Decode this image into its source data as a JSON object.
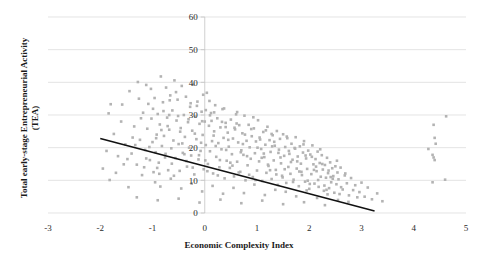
{
  "chart_data": {
    "type": "scatter",
    "title": "",
    "xlabel": "Economic Complexity Index",
    "ylabel": "Total early-stage Entrepreneurial Activity (TEA)",
    "xlim": [
      -3.4,
      5.3
    ],
    "ylim": [
      0,
      62
    ],
    "xticks": [
      -3,
      -2,
      -1,
      0,
      1,
      2,
      3,
      4,
      5
    ],
    "xtick_labels": [
      "-3",
      "-2",
      "-1",
      "0",
      "1",
      "2",
      "3",
      "4",
      "5"
    ],
    "yticks": [
      0,
      10,
      20,
      30,
      40,
      50,
      60
    ],
    "ytick_labels": [
      "0",
      "10",
      "20",
      "30",
      "40",
      "50",
      "60"
    ],
    "grid": "horizontal",
    "legend": "none",
    "marker": {
      "shape": "square",
      "color": "#b3b3b3",
      "size": 2.6
    },
    "trendline": {
      "type": "linear",
      "color": "#111111",
      "x_start": -2.0,
      "y_start": 22.8,
      "x_end": 3.25,
      "y_end": 0.6,
      "slope": -4.23,
      "intercept": 14.34
    },
    "points": [
      [
        -1.95,
        13.6
      ],
      [
        -1.82,
        10.1
      ],
      [
        -1.74,
        24.2
      ],
      [
        -1.66,
        17.4
      ],
      [
        -1.58,
        33.2
      ],
      [
        -1.52,
        21.0
      ],
      [
        -1.46,
        7.9
      ],
      [
        -1.4,
        18.2
      ],
      [
        -1.35,
        26.5
      ],
      [
        -1.3,
        14.8
      ],
      [
        -1.28,
        40.1
      ],
      [
        -1.24,
        22.4
      ],
      [
        -1.2,
        11.6
      ],
      [
        -1.18,
        30.7
      ],
      [
        -1.14,
        19.3
      ],
      [
        -1.1,
        25.8
      ],
      [
        -1.08,
        33.4
      ],
      [
        -1.05,
        16.2
      ],
      [
        -1.02,
        28.9
      ],
      [
        -1.0,
        21.7
      ],
      [
        -0.98,
        12.5
      ],
      [
        -0.96,
        35.2
      ],
      [
        -0.94,
        18.6
      ],
      [
        -0.92,
        24.0
      ],
      [
        -0.9,
        30.3
      ],
      [
        -0.88,
        15.4
      ],
      [
        -0.86,
        27.1
      ],
      [
        -0.84,
        41.8
      ],
      [
        -0.82,
        20.5
      ],
      [
        -0.8,
        33.9
      ],
      [
        -0.78,
        23.6
      ],
      [
        -0.76,
        17.0
      ],
      [
        -0.74,
        38.4
      ],
      [
        -0.72,
        29.2
      ],
      [
        -0.7,
        13.1
      ],
      [
        -0.68,
        25.5
      ],
      [
        -0.66,
        36.0
      ],
      [
        -0.64,
        19.8
      ],
      [
        -0.62,
        31.4
      ],
      [
        -0.6,
        22.2
      ],
      [
        -0.58,
        40.6
      ],
      [
        -0.56,
        16.8
      ],
      [
        -0.54,
        28.3
      ],
      [
        -0.52,
        34.7
      ],
      [
        -0.5,
        21.1
      ],
      [
        -0.48,
        12.9
      ],
      [
        -0.46,
        26.0
      ],
      [
        -0.44,
        38.9
      ],
      [
        -0.42,
        18.4
      ],
      [
        -0.4,
        30.0
      ],
      [
        -0.38,
        23.3
      ],
      [
        -0.36,
        35.6
      ],
      [
        -0.34,
        14.2
      ],
      [
        -0.32,
        27.8
      ],
      [
        -0.3,
        20.0
      ],
      [
        -0.28,
        32.5
      ],
      [
        -0.26,
        17.6
      ],
      [
        -0.24,
        25.2
      ],
      [
        -0.22,
        39.3
      ],
      [
        -0.2,
        11.8
      ],
      [
        -0.18,
        29.5
      ],
      [
        -0.16,
        22.6
      ],
      [
        -0.14,
        34.1
      ],
      [
        -0.12,
        16.4
      ],
      [
        -0.1,
        27.3
      ],
      [
        -0.08,
        19.0
      ],
      [
        -0.06,
        31.0
      ],
      [
        -0.04,
        23.9
      ],
      [
        -0.02,
        13.4
      ],
      [
        0.0,
        28.0
      ],
      [
        0.02,
        20.8
      ],
      [
        0.04,
        36.8
      ],
      [
        0.06,
        15.0
      ],
      [
        0.08,
        26.7
      ],
      [
        0.1,
        18.9
      ],
      [
        0.12,
        30.6
      ],
      [
        0.14,
        22.0
      ],
      [
        0.16,
        12.1
      ],
      [
        0.18,
        25.0
      ],
      [
        0.2,
        33.0
      ],
      [
        0.22,
        17.2
      ],
      [
        0.24,
        29.0
      ],
      [
        0.26,
        21.4
      ],
      [
        0.28,
        14.0
      ],
      [
        0.3,
        26.2
      ],
      [
        0.32,
        19.5
      ],
      [
        0.34,
        31.8
      ],
      [
        0.36,
        23.0
      ],
      [
        0.38,
        10.6
      ],
      [
        0.4,
        27.6
      ],
      [
        0.42,
        16.0
      ],
      [
        0.44,
        24.6
      ],
      [
        0.46,
        20.3
      ],
      [
        0.48,
        13.8
      ],
      [
        0.5,
        28.6
      ],
      [
        0.52,
        18.0
      ],
      [
        0.54,
        22.8
      ],
      [
        0.56,
        11.2
      ],
      [
        0.58,
        25.6
      ],
      [
        0.6,
        30.2
      ],
      [
        0.62,
        15.7
      ],
      [
        0.64,
        21.6
      ],
      [
        0.66,
        26.9
      ],
      [
        0.68,
        12.6
      ],
      [
        0.7,
        19.2
      ],
      [
        0.72,
        24.4
      ],
      [
        0.74,
        17.8
      ],
      [
        0.76,
        29.8
      ],
      [
        0.78,
        10.0
      ],
      [
        0.8,
        22.1
      ],
      [
        0.82,
        14.6
      ],
      [
        0.84,
        27.0
      ],
      [
        0.86,
        20.1
      ],
      [
        0.88,
        16.6
      ],
      [
        0.9,
        23.5
      ],
      [
        0.92,
        11.0
      ],
      [
        0.94,
        25.9
      ],
      [
        0.96,
        18.3
      ],
      [
        0.98,
        21.9
      ],
      [
        1.0,
        13.0
      ],
      [
        1.02,
        28.4
      ],
      [
        1.04,
        15.8
      ],
      [
        1.06,
        22.5
      ],
      [
        1.08,
        19.6
      ],
      [
        1.1,
        9.8
      ],
      [
        1.12,
        24.8
      ],
      [
        1.14,
        17.1
      ],
      [
        1.16,
        20.9
      ],
      [
        1.18,
        12.3
      ],
      [
        1.2,
        26.4
      ],
      [
        1.22,
        14.4
      ],
      [
        1.24,
        22.3
      ],
      [
        1.26,
        18.7
      ],
      [
        1.28,
        10.4
      ],
      [
        1.3,
        23.8
      ],
      [
        1.32,
        16.1
      ],
      [
        1.34,
        20.6
      ],
      [
        1.36,
        13.2
      ],
      [
        1.38,
        25.1
      ],
      [
        1.4,
        8.6
      ],
      [
        1.42,
        19.4
      ],
      [
        1.44,
        22.7
      ],
      [
        1.46,
        15.2
      ],
      [
        1.48,
        11.4
      ],
      [
        1.5,
        24.1
      ],
      [
        1.52,
        17.5
      ],
      [
        1.54,
        20.2
      ],
      [
        1.56,
        9.2
      ],
      [
        1.58,
        22.9
      ],
      [
        1.6,
        14.1
      ],
      [
        1.62,
        18.1
      ],
      [
        1.64,
        12.0
      ],
      [
        1.66,
        21.2
      ],
      [
        1.68,
        16.3
      ],
      [
        1.7,
        10.2
      ],
      [
        1.72,
        19.9
      ],
      [
        1.74,
        23.2
      ],
      [
        1.76,
        13.6
      ],
      [
        1.78,
        17.3
      ],
      [
        1.8,
        8.2
      ],
      [
        1.82,
        20.4
      ],
      [
        1.84,
        15.1
      ],
      [
        1.86,
        11.6
      ],
      [
        1.88,
        18.5
      ],
      [
        1.9,
        22.0
      ],
      [
        1.92,
        9.6
      ],
      [
        1.94,
        16.7
      ],
      [
        1.96,
        13.5
      ],
      [
        1.98,
        19.1
      ],
      [
        2.0,
        7.4
      ],
      [
        2.02,
        17.9
      ],
      [
        2.04,
        11.9
      ],
      [
        2.06,
        20.7
      ],
      [
        2.08,
        14.9
      ],
      [
        2.1,
        9.0
      ],
      [
        2.12,
        16.5
      ],
      [
        2.14,
        12.8
      ],
      [
        2.16,
        18.8
      ],
      [
        2.18,
        8.0
      ],
      [
        2.2,
        15.3
      ],
      [
        2.22,
        11.1
      ],
      [
        2.24,
        17.7
      ],
      [
        2.26,
        13.3
      ],
      [
        2.28,
        6.8
      ],
      [
        2.3,
        14.7
      ],
      [
        2.32,
        10.8
      ],
      [
        2.34,
        16.9
      ],
      [
        2.36,
        12.2
      ],
      [
        2.38,
        7.6
      ],
      [
        2.4,
        15.5
      ],
      [
        2.42,
        9.4
      ],
      [
        2.44,
        13.7
      ],
      [
        2.46,
        11.3
      ],
      [
        2.48,
        6.2
      ],
      [
        2.5,
        14.3
      ],
      [
        2.52,
        8.8
      ],
      [
        2.54,
        12.4
      ],
      [
        2.56,
        10.3
      ],
      [
        2.58,
        5.8
      ],
      [
        2.6,
        13.9
      ],
      [
        2.64,
        7.2
      ],
      [
        2.68,
        11.5
      ],
      [
        2.72,
        9.1
      ],
      [
        2.76,
        5.4
      ],
      [
        2.8,
        10.7
      ],
      [
        2.84,
        7.0
      ],
      [
        2.88,
        8.5
      ],
      [
        2.92,
        4.8
      ],
      [
        2.96,
        6.4
      ],
      [
        3.0,
        9.3
      ],
      [
        3.06,
        5.0
      ],
      [
        3.12,
        7.8
      ],
      [
        3.2,
        4.2
      ],
      [
        3.3,
        6.0
      ],
      [
        3.4,
        3.6
      ],
      [
        -1.88,
        19.0
      ],
      [
        -1.7,
        12.3
      ],
      [
        -1.6,
        28.0
      ],
      [
        -1.48,
        16.5
      ],
      [
        -1.38,
        23.1
      ],
      [
        -1.26,
        35.0
      ],
      [
        -1.16,
        14.0
      ],
      [
        -1.06,
        20.2
      ],
      [
        -0.99,
        31.9
      ],
      [
        -0.91,
        13.8
      ],
      [
        -0.83,
        25.4
      ],
      [
        -0.75,
        18.1
      ],
      [
        -0.67,
        34.5
      ],
      [
        -0.59,
        11.4
      ],
      [
        -0.51,
        29.7
      ],
      [
        -0.43,
        21.3
      ],
      [
        -0.35,
        15.9
      ],
      [
        -0.27,
        33.6
      ],
      [
        -0.19,
        24.3
      ],
      [
        -0.11,
        17.7
      ],
      [
        -0.03,
        36.2
      ],
      [
        0.05,
        12.8
      ],
      [
        0.13,
        28.2
      ],
      [
        0.21,
        20.5
      ],
      [
        0.29,
        16.2
      ],
      [
        0.37,
        32.0
      ],
      [
        0.45,
        22.4
      ],
      [
        0.53,
        14.5
      ],
      [
        0.61,
        27.4
      ],
      [
        0.69,
        18.6
      ],
      [
        0.77,
        24.0
      ],
      [
        0.85,
        11.7
      ],
      [
        0.93,
        29.3
      ],
      [
        1.01,
        20.0
      ],
      [
        1.09,
        16.9
      ],
      [
        1.17,
        25.3
      ],
      [
        1.25,
        13.1
      ],
      [
        1.33,
        21.8
      ],
      [
        1.41,
        18.4
      ],
      [
        1.49,
        10.9
      ],
      [
        1.57,
        23.4
      ],
      [
        1.65,
        15.6
      ],
      [
        1.73,
        19.7
      ],
      [
        1.81,
        12.7
      ],
      [
        1.89,
        21.0
      ],
      [
        1.97,
        9.9
      ],
      [
        2.05,
        17.2
      ],
      [
        2.13,
        14.2
      ],
      [
        2.21,
        19.5
      ],
      [
        2.29,
        8.4
      ],
      [
        2.37,
        13.0
      ],
      [
        2.45,
        10.5
      ],
      [
        2.53,
        16.0
      ],
      [
        2.61,
        7.9
      ],
      [
        2.69,
        12.1
      ],
      [
        -0.95,
        9.4
      ],
      [
        -0.85,
        8.1
      ],
      [
        -0.65,
        10.5
      ],
      [
        -0.45,
        7.5
      ],
      [
        -0.25,
        9.0
      ],
      [
        -0.05,
        6.6
      ],
      [
        0.15,
        8.3
      ],
      [
        0.35,
        5.9
      ],
      [
        0.55,
        7.7
      ],
      [
        0.75,
        6.1
      ],
      [
        0.95,
        8.7
      ],
      [
        1.15,
        5.5
      ],
      [
        1.35,
        7.1
      ],
      [
        1.55,
        6.5
      ],
      [
        1.75,
        5.1
      ],
      [
        1.95,
        6.9
      ],
      [
        2.15,
        4.6
      ],
      [
        2.35,
        5.7
      ],
      [
        2.55,
        4.0
      ],
      [
        2.75,
        3.4
      ],
      [
        -1.84,
        30.5
      ],
      [
        -1.55,
        14.9
      ],
      [
        -1.44,
        37.3
      ],
      [
        -1.33,
        20.8
      ],
      [
        -1.22,
        29.0
      ],
      [
        -1.12,
        16.7
      ],
      [
        -1.03,
        38.0
      ],
      [
        -0.93,
        22.9
      ],
      [
        -0.87,
        12.0
      ],
      [
        -0.79,
        31.2
      ],
      [
        -0.71,
        26.6
      ],
      [
        -0.63,
        15.1
      ],
      [
        -0.55,
        37.0
      ],
      [
        -0.47,
        24.9
      ],
      [
        -0.39,
        18.0
      ],
      [
        -0.31,
        28.7
      ],
      [
        -0.23,
        13.9
      ],
      [
        -0.15,
        32.8
      ],
      [
        -0.07,
        21.5
      ],
      [
        0.01,
        16.1
      ],
      [
        0.09,
        34.3
      ],
      [
        0.17,
        23.7
      ],
      [
        0.25,
        11.5
      ],
      [
        0.33,
        27.9
      ],
      [
        0.41,
        19.3
      ],
      [
        0.49,
        15.4
      ],
      [
        0.57,
        26.1
      ],
      [
        0.65,
        12.4
      ],
      [
        0.73,
        21.1
      ],
      [
        0.81,
        17.4
      ],
      [
        0.89,
        25.7
      ],
      [
        0.97,
        10.1
      ],
      [
        1.05,
        23.1
      ],
      [
        1.13,
        18.2
      ],
      [
        1.21,
        14.8
      ],
      [
        1.29,
        20.4
      ],
      [
        1.37,
        11.8
      ],
      [
        1.45,
        17.0
      ],
      [
        1.53,
        13.4
      ],
      [
        1.61,
        19.0
      ],
      [
        1.69,
        9.5
      ],
      [
        1.77,
        15.8
      ],
      [
        1.85,
        12.6
      ],
      [
        1.93,
        17.6
      ],
      [
        2.01,
        8.9
      ],
      [
        2.09,
        13.2
      ],
      [
        2.17,
        10.1
      ],
      [
        2.25,
        15.0
      ],
      [
        2.33,
        7.1
      ],
      [
        2.41,
        11.0
      ],
      [
        -1.3,
        4.8
      ],
      [
        -0.9,
        3.9
      ],
      [
        -0.5,
        4.4
      ],
      [
        -0.1,
        3.2
      ],
      [
        0.3,
        4.1
      ],
      [
        0.7,
        3.0
      ],
      [
        1.1,
        3.8
      ],
      [
        1.5,
        2.7
      ],
      [
        1.9,
        3.3
      ],
      [
        2.3,
        2.4
      ],
      [
        4.62,
        29.6
      ],
      [
        4.38,
        27.0
      ],
      [
        4.4,
        23.0
      ],
      [
        4.42,
        21.2
      ],
      [
        4.28,
        19.6
      ],
      [
        4.36,
        17.8
      ],
      [
        4.38,
        17.0
      ],
      [
        4.4,
        16.2
      ],
      [
        4.36,
        9.4
      ],
      [
        4.6,
        10.2
      ],
      [
        0.18,
        30.8
      ],
      [
        0.1,
        29.9
      ],
      [
        -0.05,
        28.1
      ],
      [
        0.4,
        26.3
      ],
      [
        0.02,
        31.5
      ],
      [
        -1.8,
        33.3
      ],
      [
        -1.12,
        39.2
      ],
      [
        -0.68,
        30.0
      ],
      [
        0.62,
        30.9
      ],
      [
        1.28,
        24.2
      ]
    ]
  },
  "axis_titles": {
    "x": "Economic Complexity Index",
    "y_line1": "Total early-stage Entrepreneurial Activity",
    "y_line2": "(TEA)"
  }
}
